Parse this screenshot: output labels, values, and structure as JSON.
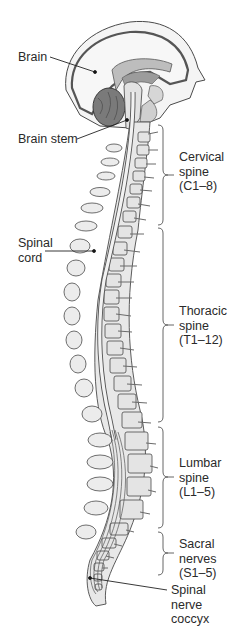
{
  "diagram": {
    "type": "anatomical-illustration",
    "colors": {
      "bone": "#e6e6e6",
      "outline": "#4a4a4a",
      "brain_dark": "#6e6e6e",
      "brain_mid": "#a8a8a8",
      "brain_light": "#d2d2d2",
      "cord": "#efefef",
      "text": "#2a2a2a"
    },
    "labels": {
      "brain": "Brain",
      "brain_stem": "Brain stem",
      "spinal_cord": "Spinal\ncord",
      "cervical": "Cervical\nspine\n(C1–8)",
      "thoracic": "Thoracic\nspine\n(T1–12)",
      "lumbar": "Lumbar\nspine\n(L1–5)",
      "sacral": "Sacral\nnerves\n(S1–5)",
      "coccyx": "Spinal\nnerve\ncoccyx"
    },
    "regions": [
      {
        "name": "Cervical spine",
        "range": "C1–8",
        "bracket_top": 125,
        "bracket_bottom": 225
      },
      {
        "name": "Thoracic spine",
        "range": "T1–12",
        "bracket_top": 228,
        "bracket_bottom": 422
      },
      {
        "name": "Lumbar spine",
        "range": "L1–5",
        "bracket_top": 427,
        "bracket_bottom": 528
      },
      {
        "name": "Sacral nerves",
        "range": "S1–5",
        "bracket_top": 532,
        "bracket_bottom": 575
      }
    ]
  }
}
